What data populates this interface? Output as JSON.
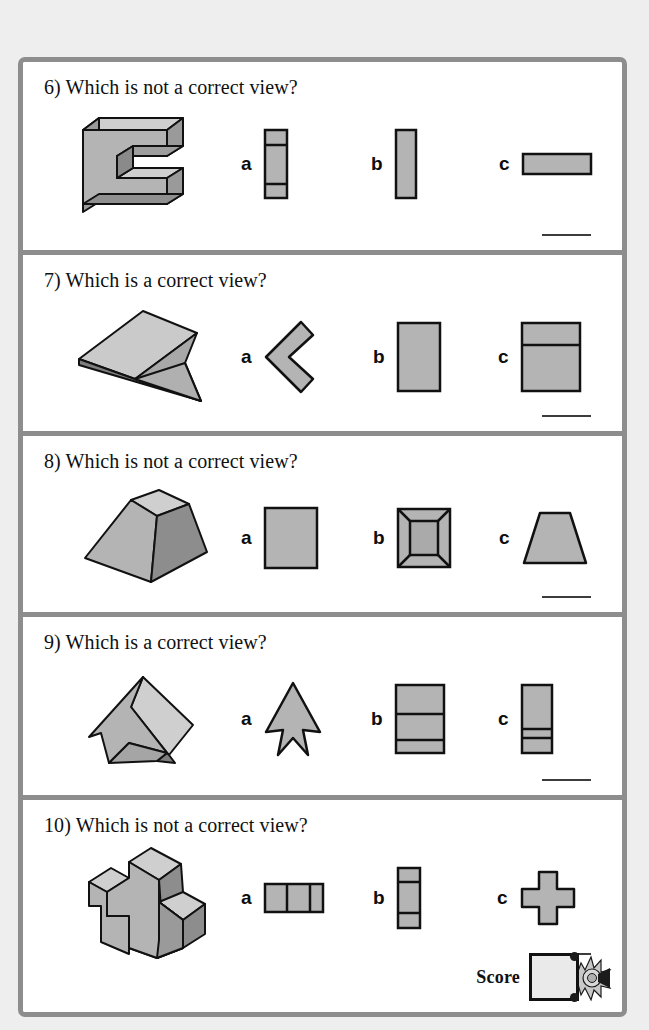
{
  "page": {
    "background_color": "#eeeeee",
    "sheet_background": "#ffffff",
    "frame_color": "#8d8d8d",
    "shape_fill": "#b4b4b4",
    "shape_fill_light": "#cfcfcf",
    "shape_fill_dark": "#8f8f8f",
    "outline_color": "#111111"
  },
  "questions": [
    {
      "number": "6)",
      "prompt": "6) Which is not a correct view?",
      "solid_name": "e-shaped-block",
      "options": [
        {
          "letter": "a",
          "figure": "vertical-bar-two-divider-lines"
        },
        {
          "letter": "b",
          "figure": "plain-vertical-bar"
        },
        {
          "letter": "c",
          "figure": "horizontal-bar"
        }
      ],
      "answer_line": true
    },
    {
      "number": "7)",
      "prompt": "7) Which is a correct view?",
      "solid_name": "folded-plate",
      "options": [
        {
          "letter": "a",
          "figure": "left-chevron"
        },
        {
          "letter": "b",
          "figure": "plain-rectangle"
        },
        {
          "letter": "c",
          "figure": "rectangle-one-horizontal-line"
        }
      ],
      "answer_line": true
    },
    {
      "number": "8)",
      "prompt": "8) Which is not a correct view?",
      "solid_name": "square-frustum",
      "options": [
        {
          "letter": "a",
          "figure": "plain-square"
        },
        {
          "letter": "b",
          "figure": "nested-square-top-view"
        },
        {
          "letter": "c",
          "figure": "trapezoid"
        }
      ],
      "answer_line": true
    },
    {
      "number": "9)",
      "prompt": "9) Which is a correct view?",
      "solid_name": "folded-kite-plate",
      "options": [
        {
          "letter": "a",
          "figure": "arrow-dart"
        },
        {
          "letter": "b",
          "figure": "rectangle-two-horizontal-lines"
        },
        {
          "letter": "c",
          "figure": "narrow-rectangle-two-lines"
        }
      ],
      "answer_line": true
    },
    {
      "number": "10)",
      "prompt": "10) Which is not a correct view?",
      "solid_name": "plus-shaped-block",
      "options": [
        {
          "letter": "a",
          "figure": "horizontal-bar-two-vertical-lines"
        },
        {
          "letter": "b",
          "figure": "vertical-bar-two-horizontal-lines"
        },
        {
          "letter": "c",
          "figure": "plus-cross"
        }
      ],
      "answer_line": true
    }
  ],
  "score": {
    "label": "Score",
    "value": "",
    "seal_icon": "rosette-ribbon-icon"
  }
}
